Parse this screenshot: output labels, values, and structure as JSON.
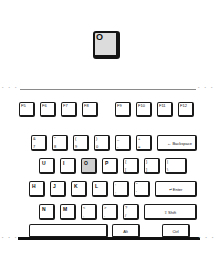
{
  "diagram": {
    "highlighted_key": "O",
    "colors": {
      "background": "#ffffff",
      "key_face": "#ffffff",
      "key_outline": "#1b1b1b",
      "highlight_face": "#cfcfcf",
      "callout_face": "#dcdcdc",
      "callout_outline": "#141414",
      "body_edge_top": "#8a8a8a",
      "body_edge_bottom": "#111111"
    }
  },
  "callout": {
    "key_label": "O"
  },
  "keyboard": {
    "top_edge_dots_left": "• • •",
    "top_edge_dots_right": "• • •",
    "bottom_edge_dots_left": "▪ ▪ ▪",
    "bottom_edge_dots_right": "▪ ▪ ▪",
    "function_row": [
      {
        "label": "F5"
      },
      {
        "label": "F6"
      },
      {
        "label": "F7"
      },
      {
        "label": "F8"
      },
      {
        "label": "F9"
      },
      {
        "label": "F10"
      },
      {
        "label": "F11"
      },
      {
        "label": "F12"
      }
    ],
    "number_row": [
      {
        "top": "&",
        "bottom": "7"
      },
      {
        "top": "*",
        "bottom": "8"
      },
      {
        "top": "(",
        "bottom": "9"
      },
      {
        "top": ")",
        "bottom": "0"
      },
      {
        "top": "_",
        "bottom": "-"
      },
      {
        "top": "+",
        "bottom": "="
      },
      {
        "label": "← Backspace"
      }
    ],
    "qwerty_row": [
      {
        "label": "U"
      },
      {
        "label": "I"
      },
      {
        "label": "O",
        "highlighted": true
      },
      {
        "label": "P"
      },
      {
        "top": "{",
        "bottom": "["
      },
      {
        "top": "}",
        "bottom": "]"
      },
      {
        "top": "|",
        "bottom": "\\"
      }
    ],
    "home_row": [
      {
        "label": "H"
      },
      {
        "label": "J"
      },
      {
        "label": "K"
      },
      {
        "label": "L"
      },
      {
        "top": ":",
        "bottom": ";"
      },
      {
        "top": "\"",
        "bottom": "'"
      },
      {
        "label": "↵ Enter"
      }
    ],
    "bottom_letter_row": [
      {
        "label": "N"
      },
      {
        "label": "M"
      },
      {
        "top": "<",
        "bottom": ","
      },
      {
        "top": ">",
        "bottom": "."
      },
      {
        "top": "?",
        "bottom": "/"
      },
      {
        "label": "⇧ Shift"
      }
    ],
    "modifier_row": [
      {
        "label": ""
      },
      {
        "label": "Alt"
      },
      {
        "label": "Ctrl"
      }
    ]
  }
}
